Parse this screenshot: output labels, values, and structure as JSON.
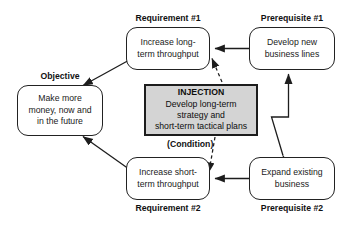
{
  "diagram": {
    "title_absent": true,
    "nodes": {
      "requirement1": {
        "caption": "Requirement #1",
        "text": "Increase long-\nterm throughput"
      },
      "prerequisite1": {
        "caption": "Prerequisite #1",
        "text": "Develop new\nbusiness lines"
      },
      "objective": {
        "caption": "Objective",
        "text": "Make more\nmoney, now and\nin the future"
      },
      "injection": {
        "title": "INJECTION",
        "text": "Develop long-term\nstrategy and\nshort-term tactical plans",
        "condition_label": "(Condition)",
        "fill_color": "#d4d4d4",
        "border_color": "#1d1d1d"
      },
      "requirement2": {
        "caption": "Requirement #2",
        "text": "Increase short-\nterm throughput"
      },
      "prerequisite2": {
        "caption": "Prerequisite #2",
        "text": "Expand existing\nbusiness"
      }
    },
    "edges": [
      {
        "name": "prerequisite1-to-requirement1",
        "style": "solid",
        "arrowheads": "end"
      },
      {
        "name": "requirement1-to-objective",
        "style": "solid",
        "arrowheads": "end"
      },
      {
        "name": "requirement2-to-objective",
        "style": "solid",
        "arrowheads": "end"
      },
      {
        "name": "prerequisite2-to-requirement2",
        "style": "solid",
        "arrowheads": "end"
      },
      {
        "name": "prerequisite2-to-prerequisite1-conflict",
        "style": "solid-zigzag",
        "arrowheads": "both"
      },
      {
        "name": "injection-to-requirement1",
        "style": "dashed",
        "arrowheads": "end"
      },
      {
        "name": "injection-to-requirement2",
        "style": "dashed",
        "arrowheads": "end"
      }
    ],
    "colors": {
      "line": "#1d1d1d",
      "node_border": "#222222",
      "background": "#ffffff",
      "text": "#1a1a1a"
    }
  }
}
